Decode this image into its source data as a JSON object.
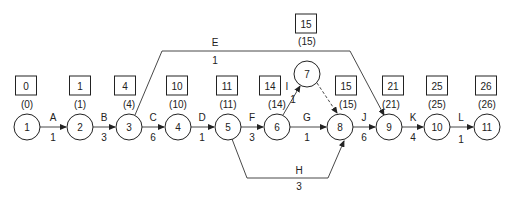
{
  "diagram": {
    "type": "activity-on-arrow network",
    "nodes": [
      {
        "id": "1",
        "label": "1",
        "x": 27,
        "y": 127,
        "earliest": "(0)",
        "box": "0",
        "box_x": 26,
        "box_y": 86,
        "paren_y": 108
      },
      {
        "id": "2",
        "label": "2",
        "x": 80,
        "y": 127,
        "earliest": "(1)",
        "box": "1",
        "box_x": 80,
        "box_y": 86,
        "paren_y": 108
      },
      {
        "id": "3",
        "label": "3",
        "x": 129,
        "y": 127,
        "earliest": "(4)",
        "box": "4",
        "box_x": 125,
        "box_y": 86,
        "paren_y": 108
      },
      {
        "id": "4",
        "label": "4",
        "x": 178,
        "y": 127,
        "earliest": "(10)",
        "box": "10",
        "box_x": 177,
        "box_y": 86,
        "paren_y": 108
      },
      {
        "id": "5",
        "label": "5",
        "x": 228,
        "y": 127,
        "earliest": "(11)",
        "box": "11",
        "box_x": 227,
        "box_y": 86,
        "paren_y": 108
      },
      {
        "id": "6",
        "label": "6",
        "x": 277,
        "y": 127,
        "earliest": "(14)",
        "box": "14",
        "box_x": 270,
        "box_y": 86,
        "paren_y": 108
      },
      {
        "id": "7",
        "label": "7",
        "x": 307,
        "y": 74,
        "earliest": "(15)",
        "box": "15",
        "box_x": 306,
        "box_y": 24,
        "paren_y": 45
      },
      {
        "id": "8",
        "label": "8",
        "x": 340,
        "y": 127,
        "earliest": "(15)",
        "box": "15",
        "box_x": 346,
        "box_y": 86,
        "paren_y": 108
      },
      {
        "id": "9",
        "label": "9",
        "x": 389,
        "y": 127,
        "earliest": "(21)",
        "box": "21",
        "box_x": 393,
        "box_y": 86,
        "paren_y": 108
      },
      {
        "id": "10",
        "label": "10",
        "x": 437,
        "y": 127,
        "earliest": "(25)",
        "box": "25",
        "box_x": 437,
        "box_y": 86,
        "paren_y": 108
      },
      {
        "id": "11",
        "label": "11",
        "x": 487,
        "y": 127,
        "earliest": "(26)",
        "box": "26",
        "box_x": 486,
        "box_y": 86,
        "paren_y": 108
      }
    ],
    "activities": [
      {
        "name": "A",
        "duration": "1",
        "from": "1",
        "to": "2"
      },
      {
        "name": "B",
        "duration": "3",
        "from": "2",
        "to": "3"
      },
      {
        "name": "C",
        "duration": "6",
        "from": "3",
        "to": "4"
      },
      {
        "name": "D",
        "duration": "1",
        "from": "4",
        "to": "5"
      },
      {
        "name": "E",
        "duration": "1",
        "from": "3",
        "to": "9"
      },
      {
        "name": "F",
        "duration": "3",
        "from": "5",
        "to": "6"
      },
      {
        "name": "G",
        "duration": "1",
        "from": "6",
        "to": "8"
      },
      {
        "name": "H",
        "duration": "3",
        "from": "5",
        "to": "8"
      },
      {
        "name": "I",
        "duration": "1",
        "from": "6",
        "to": "7"
      },
      {
        "name": "dummy",
        "duration": "",
        "from": "7",
        "to": "8"
      },
      {
        "name": "J",
        "duration": "6",
        "from": "8",
        "to": "9"
      },
      {
        "name": "K",
        "duration": "4",
        "from": "9",
        "to": "10"
      },
      {
        "name": "L",
        "duration": "1",
        "from": "10",
        "to": "11"
      }
    ]
  }
}
